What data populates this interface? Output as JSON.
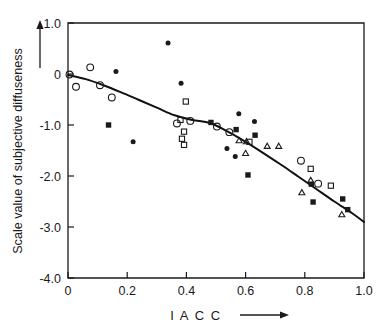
{
  "chart_data": {
    "type": "scatter",
    "title": "",
    "xlabel": "I A C C",
    "ylabel": "Scale value of subjective diffuseness",
    "xlim": [
      0.0,
      1.0
    ],
    "ylim": [
      -4.0,
      1.0
    ],
    "grid": false,
    "legend": "none",
    "xticks": [
      "0",
      "0.2",
      "0.4",
      "0.6",
      "0.8",
      "1.0"
    ],
    "xtick_values": [
      0.0,
      0.2,
      0.4,
      0.6,
      0.8,
      1.0
    ],
    "yticks": [
      "1.0",
      "0",
      "-1.0",
      "-2.0",
      "-3.0",
      "-4.0"
    ],
    "ytick_values": [
      1.0,
      0.0,
      -1.0,
      -2.0,
      -3.0,
      -4.0
    ],
    "x_axis_arrow": true,
    "y_axis_arrow": true,
    "series": [
      {
        "name": "open-circle",
        "marker": "open circle",
        "points": [
          [
            0.005,
            -0.01
          ],
          [
            0.027,
            -0.25
          ],
          [
            0.075,
            0.13
          ],
          [
            0.108,
            -0.22
          ],
          [
            0.148,
            -0.46
          ],
          [
            0.368,
            -0.97
          ],
          [
            0.413,
            -0.92
          ],
          [
            0.503,
            -1.03
          ],
          [
            0.545,
            -1.14
          ],
          [
            0.787,
            -1.7
          ],
          [
            0.845,
            -2.15
          ]
        ]
      },
      {
        "name": "filled-circle",
        "marker": "filled circle",
        "points": [
          [
            0.162,
            0.05
          ],
          [
            0.22,
            -1.33
          ],
          [
            0.338,
            0.61
          ],
          [
            0.382,
            -0.18
          ],
          [
            0.537,
            -1.46
          ],
          [
            0.565,
            -1.62
          ],
          [
            0.577,
            -0.78
          ],
          [
            0.63,
            -0.93
          ]
        ]
      },
      {
        "name": "open-square",
        "marker": "open square",
        "points": [
          [
            0.398,
            -0.54
          ],
          [
            0.38,
            -0.9
          ],
          [
            0.392,
            -1.13
          ],
          [
            0.385,
            -1.27
          ],
          [
            0.392,
            -1.39
          ],
          [
            0.613,
            -1.33
          ],
          [
            0.82,
            -1.86
          ],
          [
            0.888,
            -2.19
          ]
        ]
      },
      {
        "name": "filled-square",
        "marker": "filled square",
        "points": [
          [
            0.137,
            -1.0
          ],
          [
            0.483,
            -0.95
          ],
          [
            0.568,
            -1.09
          ],
          [
            0.608,
            -1.98
          ],
          [
            0.632,
            -1.2
          ],
          [
            0.822,
            -2.16
          ],
          [
            0.828,
            -2.51
          ],
          [
            0.928,
            -2.45
          ],
          [
            0.945,
            -2.66
          ]
        ]
      },
      {
        "name": "open-triangle",
        "marker": "open triangle",
        "points": [
          [
            0.578,
            -1.31
          ],
          [
            0.603,
            -1.33
          ],
          [
            0.6,
            -1.56
          ],
          [
            0.673,
            -1.42
          ],
          [
            0.712,
            -1.42
          ],
          [
            0.79,
            -2.33
          ],
          [
            0.82,
            -2.09
          ],
          [
            0.925,
            -2.76
          ]
        ]
      }
    ],
    "fit_curve": {
      "name": "regression curve",
      "points": [
        [
          0.0,
          -0.02
        ],
        [
          0.06,
          -0.1
        ],
        [
          0.12,
          -0.22
        ],
        [
          0.18,
          -0.36
        ],
        [
          0.24,
          -0.51
        ],
        [
          0.3,
          -0.66
        ],
        [
          0.36,
          -0.81
        ],
        [
          0.42,
          -0.9
        ],
        [
          0.48,
          -0.96
        ],
        [
          0.54,
          -1.13
        ],
        [
          0.6,
          -1.33
        ],
        [
          0.66,
          -1.55
        ],
        [
          0.72,
          -1.78
        ],
        [
          0.78,
          -2.02
        ],
        [
          0.84,
          -2.26
        ],
        [
          0.9,
          -2.5
        ],
        [
          0.96,
          -2.73
        ],
        [
          1.0,
          -2.9
        ]
      ]
    }
  },
  "axes": {
    "x_title": "I A C C",
    "y_title": "Scale value of subjective diffuseness"
  }
}
